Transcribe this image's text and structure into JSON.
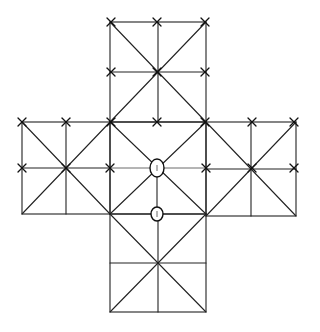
{
  "diagram": {
    "colors": {
      "line": "#222222",
      "background": "#ffffff"
    },
    "shape": "greek-cross",
    "squares": [
      {
        "id": "top",
        "x0": 110,
        "y0": 22,
        "x1": 206,
        "y1": 122
      },
      {
        "id": "left",
        "x0": 22,
        "y0": 122,
        "x1": 110,
        "y1": 214
      },
      {
        "id": "center",
        "x0": 110,
        "y0": 122,
        "x1": 206,
        "y1": 214
      },
      {
        "id": "right",
        "x0": 206,
        "y0": 122,
        "x1": 296,
        "y1": 216
      },
      {
        "id": "bottom",
        "x0": 110,
        "y0": 214,
        "x1": 206,
        "y1": 312
      }
    ],
    "x_marks": [
      [
        111,
        22
      ],
      [
        157,
        22
      ],
      [
        205,
        22
      ],
      [
        111,
        72
      ],
      [
        157,
        72
      ],
      [
        205,
        72
      ],
      [
        111,
        122
      ],
      [
        157,
        122
      ],
      [
        205,
        122
      ],
      [
        22,
        122
      ],
      [
        66,
        122
      ],
      [
        252,
        122
      ],
      [
        294,
        122
      ],
      [
        22,
        168
      ],
      [
        66,
        168
      ],
      [
        110,
        168
      ],
      [
        206,
        168
      ],
      [
        252,
        168
      ],
      [
        294,
        168
      ]
    ],
    "circled_points": [
      {
        "cx": 157,
        "cy": 168,
        "rx": 7,
        "ry": 9
      },
      {
        "cx": 157,
        "cy": 214,
        "rx": 6,
        "ry": 7
      }
    ]
  }
}
